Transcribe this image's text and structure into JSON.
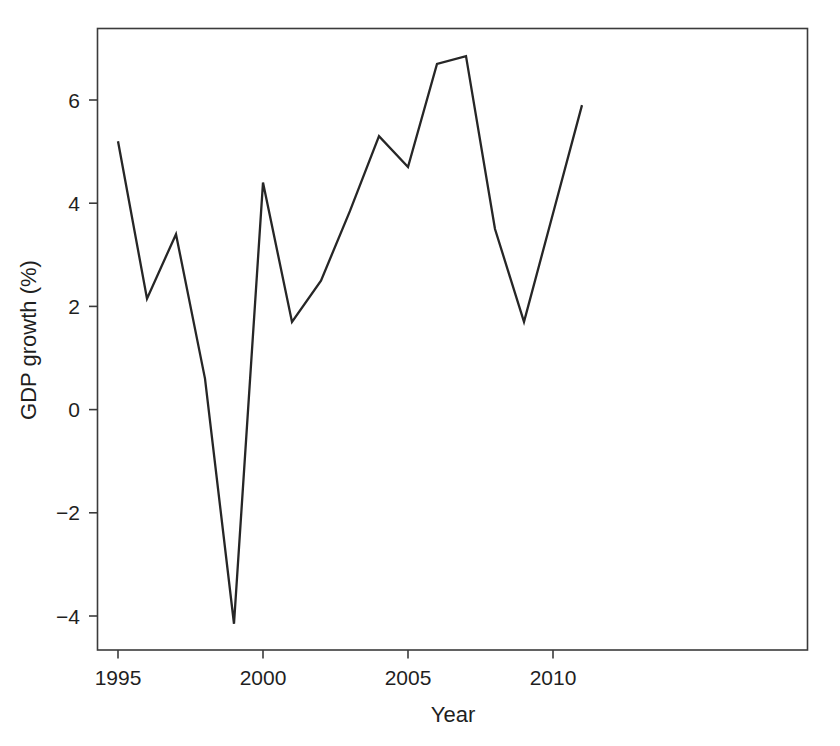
{
  "figure": {
    "background_color": "#ffffff",
    "line_color": "#262626",
    "axis_color": "#3b3b3b",
    "text_color": "#1f1f1f"
  },
  "chart_data": {
    "type": "line",
    "title": "",
    "subtitle": "",
    "xlabel": "Year",
    "ylabel": "GDP growth (%)",
    "x": [
      1995,
      1996,
      1997,
      1998,
      1999,
      2000,
      2001,
      2002,
      2003,
      2004,
      2005,
      2006,
      2007,
      2008,
      2009,
      2010,
      2011
    ],
    "values": [
      5.2,
      2.15,
      3.4,
      0.6,
      -4.15,
      4.4,
      1.7,
      2.5,
      3.85,
      5.3,
      4.7,
      6.7,
      6.85,
      3.5,
      1.7,
      3.8,
      5.9
    ],
    "series": [
      {
        "name": "GDP growth",
        "values": [
          5.2,
          2.15,
          3.4,
          0.6,
          -4.15,
          4.4,
          1.7,
          2.5,
          3.85,
          5.3,
          4.7,
          6.7,
          6.85,
          3.5,
          1.7,
          3.8,
          5.9
        ]
      }
    ],
    "xlim": [
      1994.3,
      1994.3
    ],
    "ylim": [
      -4.8,
      7.1
    ],
    "x_ticks": [
      1995,
      2000,
      2005,
      2010
    ],
    "x_tick_labels": [
      "1995",
      "2000",
      "2005",
      "2010"
    ],
    "y_ticks": [
      -4,
      -2,
      0,
      2,
      4,
      6
    ],
    "y_tick_labels": [
      "−4",
      "−2",
      "0",
      "2",
      "4",
      "6"
    ],
    "grid": false,
    "legend": false,
    "legend_position": "none",
    "annotations": []
  },
  "caption": {
    "ghost_text": ""
  }
}
